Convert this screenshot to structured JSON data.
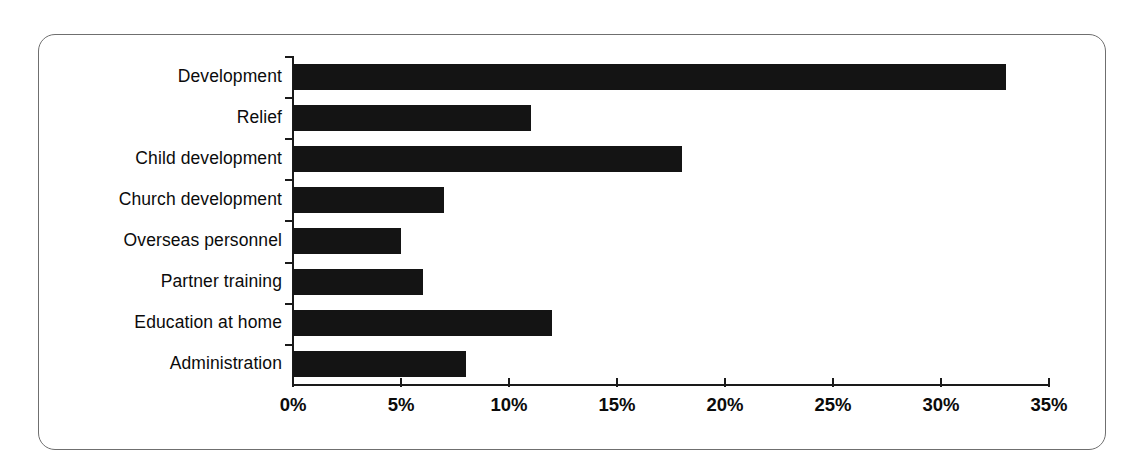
{
  "figure": {
    "frame_style": "rounded-rectangle-border",
    "border_color": "#6f6f6f",
    "background_color": "#ffffff",
    "bar_color": "#141414",
    "axis_color": "#1a1a1a"
  },
  "chart_data": {
    "type": "bar",
    "orientation": "horizontal",
    "title": "",
    "xlabel": "",
    "ylabel": "",
    "categories": [
      "Development",
      "Relief",
      "Child development",
      "Church development",
      "Overseas personnel",
      "Partner training",
      "Education at home",
      "Administration"
    ],
    "values": [
      33,
      11,
      18,
      7,
      5,
      6,
      12,
      8
    ],
    "value_labels": [
      "33%",
      "11%",
      "18%",
      "7%",
      "5%",
      "6%",
      "12%",
      "8%"
    ],
    "xlim": [
      0,
      35
    ],
    "xtick_values": [
      0,
      5,
      10,
      15,
      20,
      25,
      30,
      35
    ],
    "xtick_labels": [
      "0%",
      "5%",
      "10%",
      "15%",
      "20%",
      "25%",
      "30%",
      "35%"
    ],
    "grid": false,
    "legend": null,
    "legend_position": "none",
    "series": [
      {
        "name": "Share of expenditure",
        "values": [
          33,
          11,
          18,
          7,
          5,
          6,
          12,
          8
        ]
      }
    ]
  }
}
